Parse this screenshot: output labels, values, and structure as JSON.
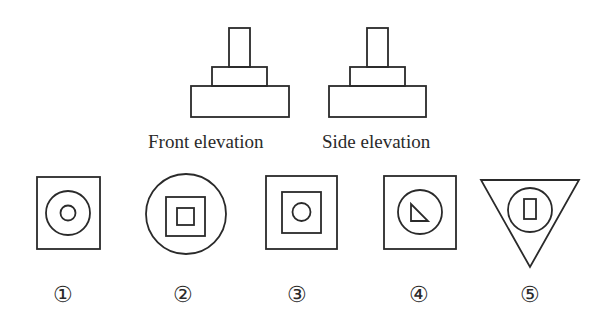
{
  "views": {
    "front": {
      "label": "Front elevation"
    },
    "side": {
      "label": "Side elevation"
    }
  },
  "options": [
    {
      "label": "①",
      "description": "square with two concentric circles"
    },
    {
      "label": "②",
      "description": "circle with two concentric squares"
    },
    {
      "label": "③",
      "description": "square with inner square and circle"
    },
    {
      "label": "④",
      "description": "square with circle and right triangle"
    },
    {
      "label": "⑤",
      "description": "inverted triangle with circle and small rectangle"
    }
  ],
  "colors": {
    "stroke": "#2a2a2a",
    "background": "#ffffff"
  }
}
